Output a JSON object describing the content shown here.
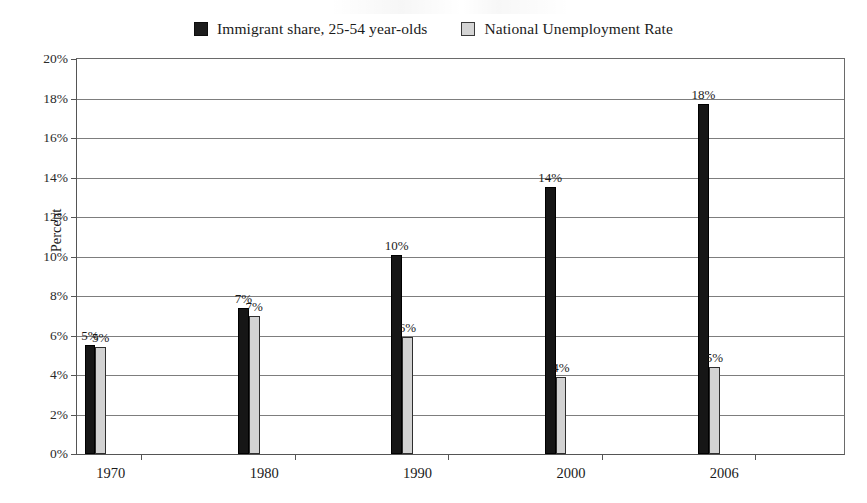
{
  "chart_data": {
    "type": "bar",
    "title": "",
    "subtitle": "",
    "xlabel": "",
    "ylabel": "Percent",
    "categories": [
      "1970",
      "1980",
      "1990",
      "2000",
      "2006"
    ],
    "ylim": [
      0,
      20
    ],
    "ytick_step": 2,
    "ytick_labels": [
      "0%",
      "2%",
      "4%",
      "6%",
      "8%",
      "10%",
      "12%",
      "14%",
      "16%",
      "18%",
      "20%"
    ],
    "grid": "horizontal",
    "legend_position": "top-center",
    "series": [
      {
        "name": "Immigrant share, 25-54 year-olds",
        "color": "#161616",
        "swatch": "dark",
        "values": [
          5.5,
          7.4,
          10.1,
          13.5,
          17.7
        ],
        "data_labels": [
          "5%",
          "7%",
          "10%",
          "14%",
          "18%"
        ]
      },
      {
        "name": "National Unemployment Rate",
        "color": "#d2d2d2",
        "swatch": "light",
        "values": [
          5.4,
          7.0,
          5.9,
          3.9,
          4.4
        ],
        "data_labels": [
          "5%",
          "7%",
          "6%",
          "4%",
          "5%"
        ]
      }
    ]
  },
  "legend": {
    "entries": [
      {
        "label": "Immigrant share, 25-54 year-olds",
        "swatch": "dark"
      },
      {
        "label": "National Unemployment Rate",
        "swatch": "light"
      }
    ]
  },
  "axes": {
    "y_title": "Percent"
  }
}
